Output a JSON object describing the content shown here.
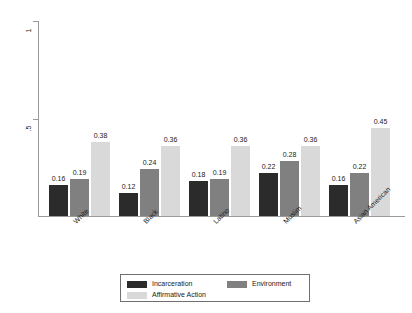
{
  "chart_data": {
    "type": "bar",
    "title": "",
    "subtitle": "",
    "xlabel": "",
    "ylabel": "Percent of Respondents",
    "ylim": [
      0,
      1
    ],
    "ytick_labels": [
      "0",
      ".5",
      "1"
    ],
    "ytick_values": [
      0,
      0.5,
      1
    ],
    "grid": false,
    "legend_position": "bottom",
    "grouped": true,
    "bar_value_labels": true,
    "categories": [
      "White",
      "Black",
      "Latino",
      "Muslim",
      "Asian American"
    ],
    "series": [
      {
        "name": "Incarceration",
        "color": "#2b2b2b",
        "values": [
          0.16,
          0.12,
          0.18,
          0.22,
          0.16
        ],
        "labels": [
          "0.16",
          "0.12",
          "0.18",
          "0.22",
          "0.16"
        ]
      },
      {
        "name": "Environment",
        "color": "#808080",
        "values": [
          0.19,
          0.24,
          0.19,
          0.28,
          0.22
        ],
        "labels": [
          "0.19",
          "0.24",
          "0.19",
          "0.28",
          "0.22"
        ]
      },
      {
        "name": "Affirmative Action",
        "color": "#d9d9d9",
        "values": [
          0.38,
          0.36,
          0.36,
          0.36,
          0.45
        ],
        "labels": [
          "0.38",
          "0.36",
          "0.36",
          "0.36",
          "0.45"
        ]
      }
    ]
  },
  "axis": {
    "y_title": "Percent of Respondents",
    "y_ticks": [
      {
        "label": "1",
        "value": 1
      },
      {
        "label": ".5",
        "value": 0.5
      }
    ]
  },
  "legend": {
    "entries": [
      {
        "label": "Incarceration",
        "color": "#2b2b2b"
      },
      {
        "label": "Environment",
        "color": "#808080"
      },
      {
        "label": "Affirmative Action",
        "color": "#d9d9d9"
      }
    ]
  },
  "colors": {
    "incarceration": "#2b2b2b",
    "environment": "#808080",
    "affirmative_action": "#d9d9d9",
    "axis": "#9a9a9a",
    "text": "#1a1a1a",
    "background": "#ffffff"
  }
}
